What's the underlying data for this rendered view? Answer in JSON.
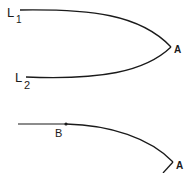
{
  "diagram": {
    "top_figure": {
      "labels": {
        "l1_main": "L",
        "l1_sub": "1",
        "l2_main": "L",
        "l2_sub": "2",
        "vertex": "A"
      },
      "description": "Two curves L1 and L2 meeting at a cusp point A"
    },
    "bottom_figure": {
      "labels": {
        "point_b": "B",
        "vertex": "A"
      },
      "description": "Straight segment joining a curve at point B, curving down to corner A"
    },
    "colors": {
      "stroke": "#1a1a1a",
      "background": "#ffffff"
    }
  }
}
